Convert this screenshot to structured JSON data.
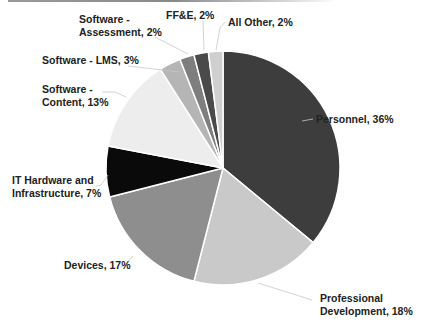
{
  "chart_data": {
    "type": "pie",
    "title": "",
    "start_angle_deg": 0,
    "direction": "clockwise",
    "center": [
      223,
      168
    ],
    "radius": 117,
    "slices": [
      {
        "label": "Personnel",
        "value": 36,
        "display": "Personnel, 36%",
        "color": "#3d3d3d"
      },
      {
        "label": "Professional Development",
        "value": 18,
        "display": "Professional Development, 18%",
        "color": "#c9c9c9"
      },
      {
        "label": "Devices",
        "value": 17,
        "display": "Devices, 17%",
        "color": "#8e8e8e"
      },
      {
        "label": "IT Hardware and Infrastructure",
        "value": 7,
        "display": "IT Hardware and Infrastructure, 7%",
        "color": "#0a0a0a"
      },
      {
        "label": "Software - Content",
        "value": 13,
        "display": "Software - Content, 13%",
        "color": "#ededed"
      },
      {
        "label": "Software - LMS",
        "value": 3,
        "display": "Software - LMS, 3%",
        "color": "#b5b5b5"
      },
      {
        "label": "Software - Assessment",
        "value": 2,
        "display": "Software - Assessment, 2%",
        "color": "#7e7e7e"
      },
      {
        "label": "FF&E",
        "value": 2,
        "display": "FF&E, 2%",
        "color": "#4a4a4a"
      },
      {
        "label": "All Other",
        "value": 2,
        "display": "All Other, 2%",
        "color": "#cfcfcf"
      }
    ],
    "categories": [
      "Personnel",
      "Professional Development",
      "Devices",
      "IT Hardware and Infrastructure",
      "Software - Content",
      "Software - LMS",
      "Software - Assessment",
      "FF&E",
      "All Other"
    ],
    "values": [
      36,
      18,
      17,
      7,
      13,
      3,
      2,
      2,
      2
    ],
    "legend": "none (data labels with leader lines)"
  },
  "labels": {
    "personnel": [
      "Personnel, 36%"
    ],
    "prof_dev": [
      "Professional",
      "Development, 18%"
    ],
    "devices": [
      "Devices, 17%"
    ],
    "it_hardware": [
      "IT Hardware and",
      "Infrastructure, 7%"
    ],
    "sw_content": [
      "Software -",
      "Content, 13%"
    ],
    "sw_lms": [
      "Software - LMS, 3%"
    ],
    "sw_assessment": [
      "Software -",
      "Assessment, 2%"
    ],
    "ffe": [
      "FF&E, 2%"
    ],
    "all_other": [
      "All Other, 2%"
    ]
  }
}
